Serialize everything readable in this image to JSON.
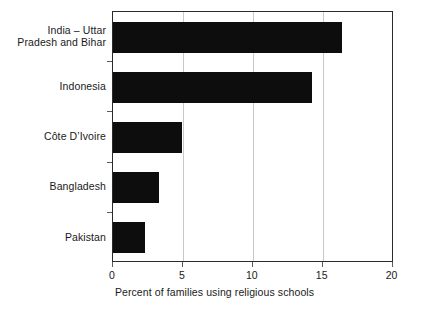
{
  "chart_data": {
    "type": "bar",
    "orientation": "horizontal",
    "title": "",
    "xlabel": "Percent of families using religious schools",
    "ylabel": "",
    "categories": [
      "India – Uttar\nPradesh and Bihar",
      "Indonesia",
      "Côte D’Ivoire",
      "Bangladesh",
      "Pakistan"
    ],
    "values": [
      16.4,
      14.2,
      4.9,
      3.3,
      2.3
    ],
    "xlim": [
      0,
      20
    ],
    "xticks": [
      0,
      5,
      10,
      15,
      20
    ],
    "xtick_labels": [
      "0",
      "5",
      "10",
      "15",
      "20"
    ],
    "grid": "vertical-only",
    "legend": "none",
    "bar_color": "#0d0d0d",
    "gridline_color": "#c9c9c9",
    "frame_color": "#2b2b2b"
  }
}
